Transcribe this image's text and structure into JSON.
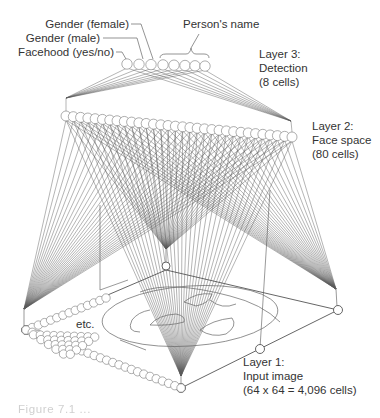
{
  "diagram": {
    "layer3": {
      "label_line1": "Layer 3:",
      "label_line2": "Detection",
      "label_line3": "(8 cells)",
      "cell_count": 8,
      "cell_labels": {
        "gender_female": "Gender (female)",
        "gender_male": "Gender (male)",
        "facehood": "Facehood (yes/no)",
        "person_name": "Person's name"
      }
    },
    "layer2": {
      "label_line1": "Layer 2:",
      "label_line2": "Face space",
      "label_line3": "(80 cells)",
      "cell_count": 80,
      "visible_cells": 32
    },
    "layer1": {
      "label_line1": "Layer 1:",
      "label_line2": "Input image",
      "label_line3": "(64 x 64 = 4,096 cells)",
      "grid": "64 x 64",
      "cell_count": 4096,
      "etc_label": "etc."
    },
    "caption": "Figure 7.1 ..."
  },
  "colors": {
    "line": "#555555",
    "circle_stroke": "#666666",
    "text": "#333333",
    "background": "#ffffff"
  }
}
